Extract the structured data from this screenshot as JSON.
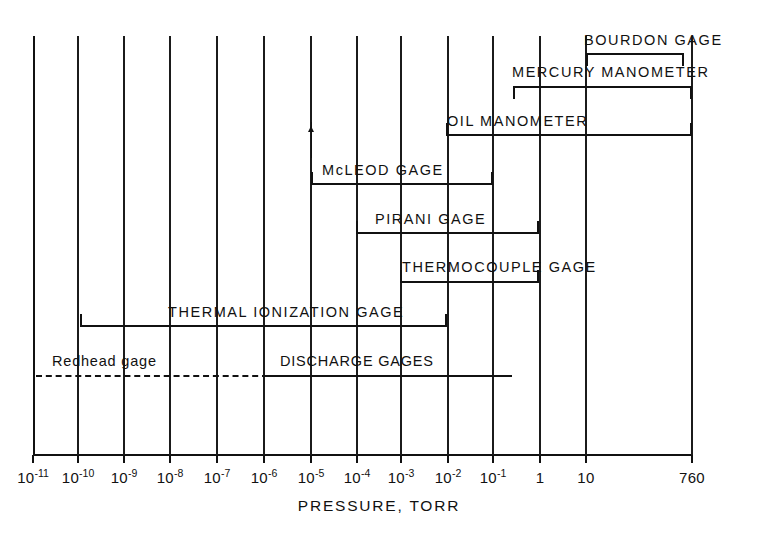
{
  "chart_data": {
    "type": "bar",
    "orientation": "horizontal-range",
    "title": "",
    "xlabel": "PRESSURE, TORR",
    "ylabel": "",
    "scale": "log",
    "xlim": [
      1e-11,
      760
    ],
    "grid": true,
    "legend": "none",
    "axis": {
      "tick_labels": [
        "10-11",
        "10-10",
        "10-9",
        "10-8",
        "10-7",
        "10-6",
        "10-5",
        "10-4",
        "10-3",
        "10-2",
        "10-1",
        "1",
        "10",
        "760"
      ],
      "tick_mantissas": [
        "10",
        "10",
        "10",
        "10",
        "10",
        "10",
        "10",
        "10",
        "10",
        "10",
        "10",
        "1",
        "10",
        "760"
      ],
      "tick_exponents": [
        "-11",
        "-10",
        "-9",
        "-8",
        "-7",
        "-6",
        "-5",
        "-4",
        "-3",
        "-2",
        "-1",
        "",
        "",
        ""
      ],
      "tick_values": [
        1e-11,
        1e-10,
        1e-09,
        1e-08,
        1e-07,
        1e-06,
        1e-05,
        0.0001,
        0.001,
        0.01,
        0.1,
        1,
        10,
        760
      ],
      "tick_x": [
        33,
        78,
        124,
        170,
        217,
        264,
        311,
        357,
        401,
        448,
        493,
        540,
        586,
        692
      ]
    },
    "ranges": [
      {
        "name": "BOURDON GAGE",
        "x_min": 10,
        "x_max": 760,
        "line_style": "solid",
        "label_align": "left",
        "caps": "down",
        "px": {
          "x1": 586,
          "x2": 684,
          "y": 53,
          "label_x": 584,
          "label_y": 33
        }
      },
      {
        "name": "MERCURY MANOMETER",
        "x_min": 1,
        "x_max": 760,
        "line_style": "solid",
        "label_align": "left",
        "caps": "down",
        "px": {
          "x1": 513,
          "x2": 692,
          "y": 86,
          "label_x": 512,
          "label_y": 65
        }
      },
      {
        "name": "OIL MANOMETER",
        "x_min": 0.01,
        "x_max": 760,
        "line_style": "solid",
        "label_align": "left",
        "caps": "up",
        "px": {
          "x1": 446,
          "x2": 692,
          "y": 134,
          "label_x": 447,
          "label_y": 114
        }
      },
      {
        "name": "McLEOD GAGE",
        "x_min": 1e-05,
        "x_max": 0.001,
        "line_style": "solid",
        "label_align": "left",
        "caps": "up",
        "px": {
          "x1": 311,
          "x2": 493,
          "y": 183,
          "label_x": 322,
          "label_y": 163
        }
      },
      {
        "name": "PIRANI GAGE",
        "x_min": 0.0001,
        "x_max": 1,
        "line_style": "solid",
        "label_align": "left",
        "caps": "up",
        "px": {
          "x1": 356,
          "x2": 539,
          "y": 232,
          "label_x": 375,
          "label_y": 212
        }
      },
      {
        "name": "THERMOCOUPLE GAGE",
        "x_min": 0.001,
        "x_max": 1,
        "line_style": "solid",
        "label_align": "left",
        "caps": "up",
        "px": {
          "x1": 400,
          "x2": 539,
          "y": 281,
          "label_x": 402,
          "label_y": 260
        }
      },
      {
        "name": "THERMAL IONIZATION GAGE",
        "x_min": 1e-10,
        "x_max": 0.001,
        "line_style": "solid",
        "label_align": "left",
        "caps": "up",
        "px": {
          "x1": 80,
          "x2": 447,
          "y": 325,
          "label_x": 168,
          "label_y": 305
        }
      },
      {
        "name": "DISCHARGE GAGES",
        "x_min": 1e-11,
        "x_max": 0.01,
        "line_style": "dashed-then-solid",
        "label_align": "left",
        "caps": "none",
        "px": {
          "x1": 36,
          "x2": 512,
          "dash_end": 268,
          "y": 375,
          "label_x": 280,
          "label_y": 354
        }
      },
      {
        "name": "Redhead gage",
        "x_min": 1e-11,
        "x_max": 1e-06,
        "line_style": "dashed",
        "label_align": "left",
        "caps": "none",
        "note": "annotation on dashed portion of discharge gages bar",
        "px": {
          "label_x": 52,
          "label_y": 354
        }
      }
    ]
  }
}
